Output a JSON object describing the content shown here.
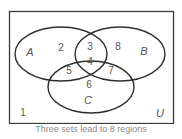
{
  "diagram": {
    "type": "venn",
    "universe_label": "U",
    "sets": [
      {
        "name": "A",
        "label": "A"
      },
      {
        "name": "B",
        "label": "B"
      },
      {
        "name": "C",
        "label": "C"
      }
    ],
    "regions": [
      {
        "id": "outside",
        "label": "1"
      },
      {
        "id": "A_only",
        "label": "2"
      },
      {
        "id": "A_and_B_only",
        "label": "3"
      },
      {
        "id": "A_and_B_and_C",
        "label": "4"
      },
      {
        "id": "A_and_C_only",
        "label": "5"
      },
      {
        "id": "C_only",
        "label": "6"
      },
      {
        "id": "B_and_C_only",
        "label": "7"
      },
      {
        "id": "B_only",
        "label": "8"
      }
    ],
    "caption": "Three sets lead to 8 regions"
  }
}
